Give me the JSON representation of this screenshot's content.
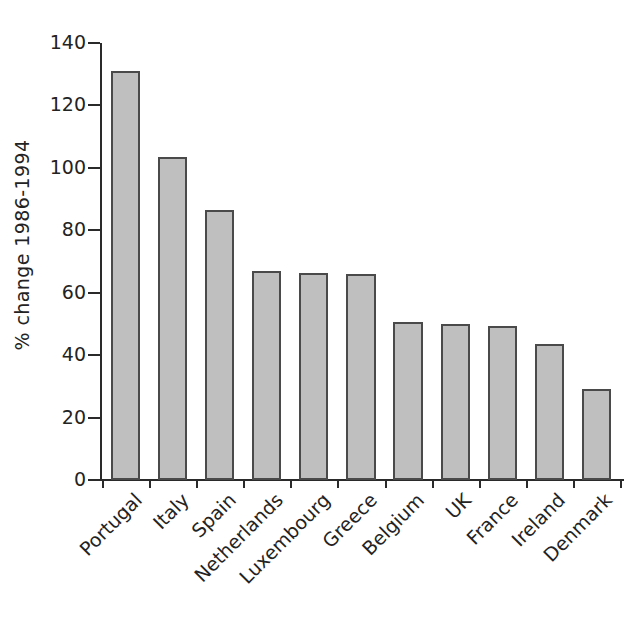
{
  "chart_data": {
    "type": "bar",
    "title": "",
    "subtitle": "",
    "xlabel": "",
    "ylabel": "% change 1986-1994",
    "categories": [
      "Portugal",
      "Italy",
      "Spain",
      "Netherlands",
      "Luxembourg",
      "Greece",
      "Belgium",
      "UK",
      "France",
      "Ireland",
      "Denmark"
    ],
    "values": [
      131,
      103.5,
      86.5,
      67,
      66.3,
      66,
      50.5,
      50,
      49.3,
      43.7,
      29
    ],
    "ylim": [
      0,
      140
    ],
    "yticks": [
      0,
      20,
      40,
      60,
      80,
      100,
      120,
      140
    ],
    "ytick_labels": [
      "0",
      "20",
      "40",
      "60",
      "80",
      "100",
      "120",
      "140"
    ],
    "grid": false,
    "legend": null,
    "bar_color": "#bfbfbf",
    "bar_edge_color": "#4a4a4a",
    "axis_color": "#2a2a2a",
    "background": "#ffffff",
    "xtick_label_rotation": -45
  }
}
